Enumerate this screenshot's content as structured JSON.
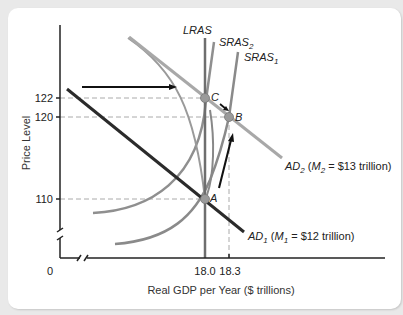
{
  "diagram": {
    "type": "AD-AS model",
    "y_axis": {
      "title": "Price Level",
      "ticks": [
        {
          "label": "122",
          "value": 122
        },
        {
          "label": "120",
          "value": 120
        },
        {
          "label": "110",
          "value": 110
        }
      ],
      "origin_label": "0"
    },
    "x_axis": {
      "title": "Real GDP per Year ($ trillions)",
      "ticks": [
        {
          "label": "18.0",
          "value": 18.0
        },
        {
          "label": "18.3",
          "value": 18.3
        }
      ]
    },
    "curves": {
      "lras": {
        "label": "LRAS"
      },
      "sras2": {
        "label": "SRAS",
        "sub": "2"
      },
      "sras1": {
        "label": "SRAS",
        "sub": "1"
      },
      "ad2": {
        "label": "AD",
        "sub": "2",
        "detail_pre": " (",
        "m": "M",
        "msub": "2",
        "detail_post": " = $13 trillion)"
      },
      "ad1": {
        "label": "AD",
        "sub": "1",
        "detail_pre": " (",
        "m": "M",
        "msub": "1",
        "detail_post": " = $12 trillion)"
      }
    },
    "points": [
      {
        "label": "A",
        "gdp": 18.0,
        "price": 110
      },
      {
        "label": "B",
        "gdp": 18.3,
        "price": 120
      },
      {
        "label": "C",
        "gdp": 18.0,
        "price": 122
      }
    ],
    "colors": {
      "axis": "#222222",
      "ad1": "#2b2b2b",
      "ad2": "#a8a8a8",
      "sras": "#8a8a8a",
      "lras": "#6e6e6e",
      "dash": "#aaaaaa",
      "point": "#9a9a9a",
      "arrow": "#111111"
    }
  }
}
